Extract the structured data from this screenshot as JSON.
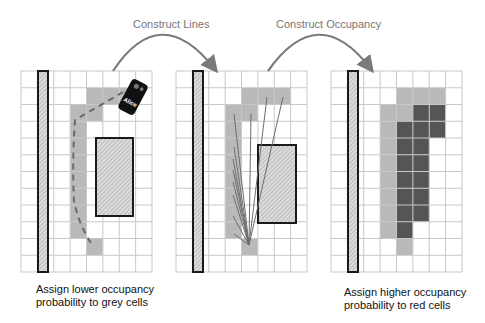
{
  "steps": [
    {
      "label": "Construct Lines"
    },
    {
      "label": "Construct Occupancy"
    }
  ],
  "captions": {
    "left": {
      "line1": "Assign lower occupancy",
      "line2": "probability to grey cells"
    },
    "right": {
      "line1": "Assign higher occupancy",
      "line2": "probability to red cells"
    }
  },
  "agent": {
    "label": "Alice"
  },
  "grid": {
    "cols": 8,
    "rows": 12
  },
  "colors": {
    "grid_line": "#c8c8c8",
    "grey_cell": "#b9b9b9",
    "red_cell": "#555555",
    "arrow": "#7a7a7a",
    "obstacle_border": "#1a1a1a",
    "ray": "#6e6e6e",
    "path": "#6a6a6a"
  },
  "panels": [
    {
      "name": "panel-observation",
      "grey_cells": [
        [
          1,
          4
        ],
        [
          1,
          5
        ],
        [
          1,
          6
        ],
        [
          2,
          3
        ],
        [
          2,
          4
        ],
        [
          3,
          3
        ],
        [
          4,
          3
        ],
        [
          5,
          3
        ],
        [
          6,
          3
        ],
        [
          7,
          3
        ],
        [
          8,
          3
        ],
        [
          9,
          3
        ],
        [
          10,
          4
        ]
      ],
      "red_cells": []
    },
    {
      "name": "panel-lines",
      "grey_cells": [
        [
          1,
          4
        ],
        [
          1,
          5
        ],
        [
          1,
          6
        ],
        [
          2,
          3
        ],
        [
          2,
          4
        ],
        [
          3,
          3
        ],
        [
          4,
          3
        ],
        [
          5,
          3
        ],
        [
          6,
          3
        ],
        [
          7,
          3
        ],
        [
          8,
          3
        ],
        [
          9,
          3
        ],
        [
          10,
          4
        ]
      ],
      "red_cells": []
    },
    {
      "name": "panel-occupancy",
      "grey_cells": [
        [
          1,
          4
        ],
        [
          1,
          5
        ],
        [
          1,
          6
        ],
        [
          2,
          3
        ],
        [
          2,
          4
        ],
        [
          3,
          3
        ],
        [
          4,
          3
        ],
        [
          5,
          3
        ],
        [
          6,
          3
        ],
        [
          7,
          3
        ],
        [
          8,
          3
        ],
        [
          9,
          3
        ],
        [
          10,
          4
        ]
      ],
      "red_cells": [
        [
          2,
          5
        ],
        [
          2,
          6
        ],
        [
          3,
          4
        ],
        [
          3,
          5
        ],
        [
          3,
          6
        ],
        [
          4,
          4
        ],
        [
          4,
          5
        ],
        [
          5,
          4
        ],
        [
          5,
          5
        ],
        [
          6,
          4
        ],
        [
          6,
          5
        ],
        [
          7,
          4
        ],
        [
          7,
          5
        ],
        [
          8,
          4
        ],
        [
          8,
          5
        ],
        [
          9,
          4
        ]
      ]
    }
  ]
}
